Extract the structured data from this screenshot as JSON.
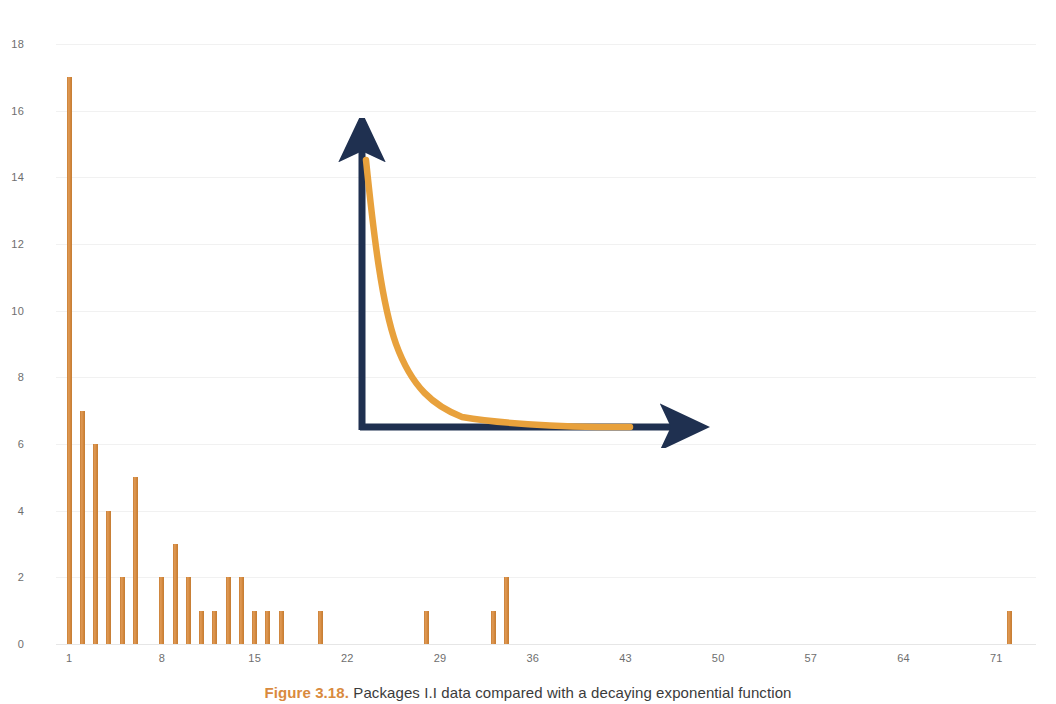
{
  "caption": {
    "figure_number": "Figure 3.18.",
    "text": "Packages I.I data compared with a decaying exponential function"
  },
  "colors": {
    "bar": "#d98a3e",
    "axis_navy": "#1f3050",
    "curve_orange": "#e8a13c",
    "grid": "#f1f1f1",
    "tick_text": "#6e6e6e"
  },
  "inset": {
    "name": "decaying-exponential-sketch",
    "y_axis_label": "",
    "x_axis_label": "",
    "description": "decaying exponential curve with arrow axes"
  },
  "chart_data": {
    "type": "bar",
    "title": "",
    "xlabel": "",
    "ylabel": "",
    "xlim": [
      0,
      74
    ],
    "ylim": [
      0,
      18
    ],
    "grid": true,
    "legend": "none",
    "y_ticks": [
      0,
      2,
      4,
      6,
      8,
      10,
      12,
      14,
      16,
      18
    ],
    "x_ticks": [
      1,
      8,
      15,
      22,
      29,
      36,
      43,
      50,
      57,
      64,
      71
    ],
    "x": [
      1,
      2,
      3,
      4,
      5,
      6,
      8,
      9,
      10,
      11,
      12,
      13,
      14,
      15,
      16,
      17,
      20,
      28,
      33,
      34,
      72
    ],
    "values": [
      17,
      7,
      6,
      4,
      2,
      5,
      2,
      3,
      2,
      1,
      1,
      2,
      2,
      1,
      1,
      1,
      1,
      1,
      1,
      2,
      1
    ],
    "categories": [
      "1",
      "2",
      "3",
      "4",
      "5",
      "6",
      "8",
      "9",
      "10",
      "11",
      "12",
      "13",
      "14",
      "15",
      "16",
      "17",
      "20",
      "28",
      "33",
      "34",
      "72"
    ]
  }
}
